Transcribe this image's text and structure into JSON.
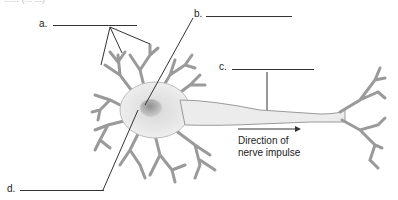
{
  "diagram": {
    "top_cut_text": "...... (... ...)",
    "labels": [
      {
        "id": "a",
        "text": "a.",
        "points_to": "dendrites"
      },
      {
        "id": "b",
        "text": "b.",
        "points_to": "cell body"
      },
      {
        "id": "c",
        "text": "c.",
        "points_to": "axon"
      },
      {
        "id": "d",
        "text": "d.",
        "points_to": "nucleus"
      }
    ],
    "arrow_caption": {
      "line1": "Direction of",
      "line2": "nerve impulse"
    },
    "colors": {
      "line": "#333333",
      "neuron_outline": "#8a8a8a",
      "neuron_fill": "#e6e6e6",
      "nucleus": "#a8a8a8"
    }
  }
}
